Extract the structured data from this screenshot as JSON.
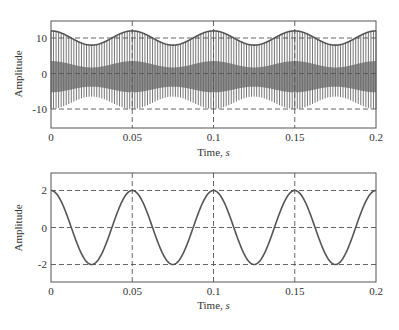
{
  "chart_data": [
    {
      "type": "line",
      "title": "",
      "xlabel": "Time, s",
      "ylabel": "Amplitude",
      "xlim": [
        0,
        0.2
      ],
      "ylim": [
        -15,
        15
      ],
      "xticks": [
        "0",
        "0.05",
        "0.1",
        "0.15",
        "0.2"
      ],
      "yticks": [
        "-10",
        "0",
        "10"
      ],
      "grid": "dashed at ticks",
      "description": "Pulse-modulated signal: dense vertical pulse train whose positive peaks follow an envelope 10 + 2cos(2π·20t) and negative tips follow -(8.25) - 1.75cos(2π·20t); envelope line drawn on top",
      "series": [
        {
          "name": "envelope",
          "x": [
            0,
            0.0125,
            0.025,
            0.0375,
            0.05,
            0.0625,
            0.075,
            0.0875,
            0.1,
            0.1125,
            0.125,
            0.1375,
            0.15,
            0.1625,
            0.175,
            0.1875,
            0.2
          ],
          "values": [
            12,
            10,
            8,
            10,
            12,
            10,
            8,
            10,
            12,
            10,
            8,
            10,
            12,
            10,
            8,
            10,
            12
          ]
        },
        {
          "name": "pulse-train-lower-tips",
          "x": [
            0,
            0.025,
            0.05,
            0.075,
            0.1,
            0.125,
            0.15,
            0.175,
            0.2
          ],
          "values": [
            -10,
            -6.5,
            -10,
            -6.5,
            -10,
            -6.5,
            -10,
            -6.5,
            -10
          ]
        }
      ]
    },
    {
      "type": "line",
      "title": "",
      "xlabel": "Time, s",
      "ylabel": "Amplitude",
      "xlim": [
        0,
        0.2
      ],
      "ylim": [
        -3,
        3
      ],
      "xticks": [
        "0",
        "0.05",
        "0.1",
        "0.15",
        "0.2"
      ],
      "yticks": [
        "-2",
        "0",
        "2"
      ],
      "grid": "dashed at ticks",
      "description": "Cosine 2cos(2π·20t)",
      "series": [
        {
          "name": "modulating-signal",
          "x": [
            0,
            0.0125,
            0.025,
            0.0375,
            0.05,
            0.0625,
            0.075,
            0.0875,
            0.1,
            0.1125,
            0.125,
            0.1375,
            0.15,
            0.1625,
            0.175,
            0.1875,
            0.2
          ],
          "values": [
            2,
            0,
            -2,
            0,
            2,
            0,
            -2,
            0,
            2,
            0,
            -2,
            0,
            2,
            0,
            -2,
            0,
            2
          ]
        }
      ]
    }
  ],
  "plots": {
    "top": {
      "ylabel": "Amplitude",
      "xlabel": "Time, ",
      "xlabel_var": "s",
      "yticks": [
        "10",
        "0",
        "-10"
      ],
      "xticks": [
        "0",
        "0.05",
        "0.1",
        "0.15",
        "0.2"
      ]
    },
    "bottom": {
      "ylabel": "Amplitude",
      "xlabel": "Time, ",
      "xlabel_var": "s",
      "yticks": [
        "2",
        "0",
        "-2"
      ],
      "xticks": [
        "0",
        "0.05",
        "0.1",
        "0.15",
        "0.2"
      ]
    }
  },
  "colors": {
    "line": "#555555",
    "axis": "#555555",
    "grid": "#555555",
    "text": "#333333"
  }
}
